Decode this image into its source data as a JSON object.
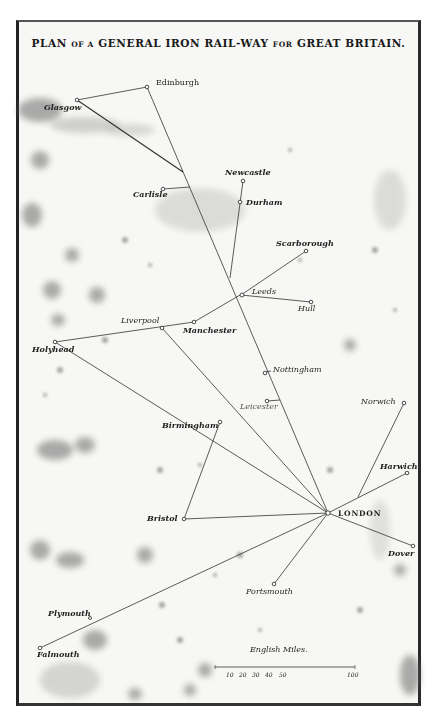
{
  "title": {
    "parts": [
      "PLAN",
      "OF A",
      "GENERAL IRON RAIL-WAY",
      "FOR",
      "GREAT BRITAIN."
    ]
  },
  "towns": {
    "edinburgh": "Edinburgh",
    "glasgow": "Glasgow",
    "carlisle": "Carlisle",
    "newcastle": "Newcastle",
    "durham": "Durham",
    "scarborough": "Scarborough",
    "leeds": "Leeds",
    "hull": "Hull",
    "liverpool": "Liverpool",
    "manchester": "Manchester",
    "holyhead": "Holyhead",
    "nottingham": "Nottingham",
    "leicester": "Leicester",
    "birmingham": "Birmingham",
    "norwich": "Norwich",
    "harwich": "Harwich",
    "london": "LONDON",
    "bristol": "Bristol",
    "dover": "Dover",
    "portsmouth": "Portsmouth",
    "plymouth": "Plymouth",
    "falmouth": "Falmouth"
  },
  "scale": {
    "title": "English Miles.",
    "ticks": [
      "10",
      "20",
      "30",
      "40",
      "50",
      "100"
    ]
  }
}
